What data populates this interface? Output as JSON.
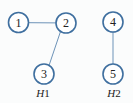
{
  "diagram": {
    "type": "graph",
    "colors": {
      "node_stroke": "#3f6f9f",
      "edge": "#6d93b8",
      "text": "#222222"
    },
    "nodes": [
      {
        "id": "1",
        "label": "1",
        "x": 18.5,
        "y": 22.5
      },
      {
        "id": "2",
        "label": "2",
        "x": 66,
        "y": 23
      },
      {
        "id": "3",
        "label": "3",
        "x": 44,
        "y": 74
      },
      {
        "id": "4",
        "label": "4",
        "x": 113,
        "y": 22
      },
      {
        "id": "5",
        "label": "5",
        "x": 113,
        "y": 74
      }
    ],
    "edges": [
      {
        "from": "1",
        "to": "2"
      },
      {
        "from": "2",
        "to": "3"
      },
      {
        "from": "4",
        "to": "5"
      }
    ],
    "graphs": [
      {
        "name": "H1",
        "letter": "H",
        "number": "1",
        "nodes": [
          "1",
          "2",
          "3"
        ]
      },
      {
        "name": "H2",
        "letter": "H",
        "number": "2",
        "nodes": [
          "4",
          "5"
        ]
      }
    ]
  }
}
